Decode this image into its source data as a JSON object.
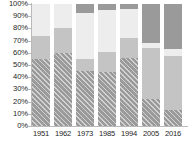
{
  "chart_data": {
    "type": "bar",
    "stacked": true,
    "stack_mode": "percent",
    "title": "",
    "subtitle": "",
    "xlabel": "",
    "ylabel": "",
    "grid": false,
    "legend": "none",
    "categories": [
      "1951",
      "1962",
      "1973",
      "1985",
      "1994",
      "2005",
      "2016"
    ],
    "ylim": [
      0,
      100
    ],
    "ytick_labels": [
      "100%",
      "90%",
      "80%",
      "70%",
      "60%",
      "50%",
      "40%",
      "30%",
      "20%",
      "10%",
      "0%"
    ],
    "ytick_values": [
      100,
      90,
      80,
      70,
      60,
      50,
      40,
      30,
      20,
      10,
      0
    ],
    "series": [
      {
        "name": "segment-1-hatched",
        "pattern": "diagonal-hatch",
        "color": "#9a9a9a",
        "values": [
          55,
          60,
          45,
          44,
          56,
          22,
          13
        ]
      },
      {
        "name": "segment-2-medium",
        "pattern": "solid",
        "color": "#c4c4c4",
        "values": [
          19,
          20,
          10,
          17,
          16,
          42,
          44
        ]
      },
      {
        "name": "segment-3-light",
        "pattern": "solid",
        "color": "#ededed",
        "values": [
          26,
          20,
          38,
          34,
          24,
          4,
          6
        ]
      },
      {
        "name": "segment-4-dark",
        "pattern": "solid",
        "color": "#9a9a9a",
        "values": [
          0,
          0,
          7,
          5,
          4,
          32,
          37
        ]
      }
    ],
    "colors": {
      "hatched": "#9a9a9a",
      "medium": "#c4c4c4",
      "light": "#ededed",
      "dark": "#9a9a9a",
      "axis": "#b9b9b9",
      "text": "#262626",
      "background": "#ffffff"
    }
  }
}
